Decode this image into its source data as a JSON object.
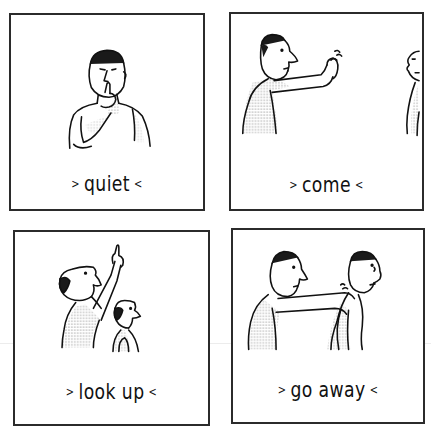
{
  "panels": [
    {
      "id": "quiet",
      "label": "quiet",
      "left_mark": ">",
      "right_mark": "<",
      "figures": [
        "man-finger-on-lips"
      ]
    },
    {
      "id": "come",
      "label": "come",
      "left_mark": ">",
      "right_mark": "<",
      "figures": [
        "man-beckoning-with-hand",
        "man-partially-visible-at-right-edge"
      ]
    },
    {
      "id": "look-up",
      "label": "look up",
      "left_mark": ">",
      "right_mark": "<",
      "figures": [
        "man-pointing-upward",
        "boy-looking-up"
      ]
    },
    {
      "id": "go-away",
      "label": "go away",
      "left_mark": ">",
      "right_mark": "<",
      "figures": [
        "man-pushing-shoulders",
        "man-being-pushed"
      ]
    }
  ],
  "colors": {
    "ink": "#111111",
    "frame": "#2b2b2b",
    "background": "#ffffff",
    "stipple": "#555555"
  }
}
